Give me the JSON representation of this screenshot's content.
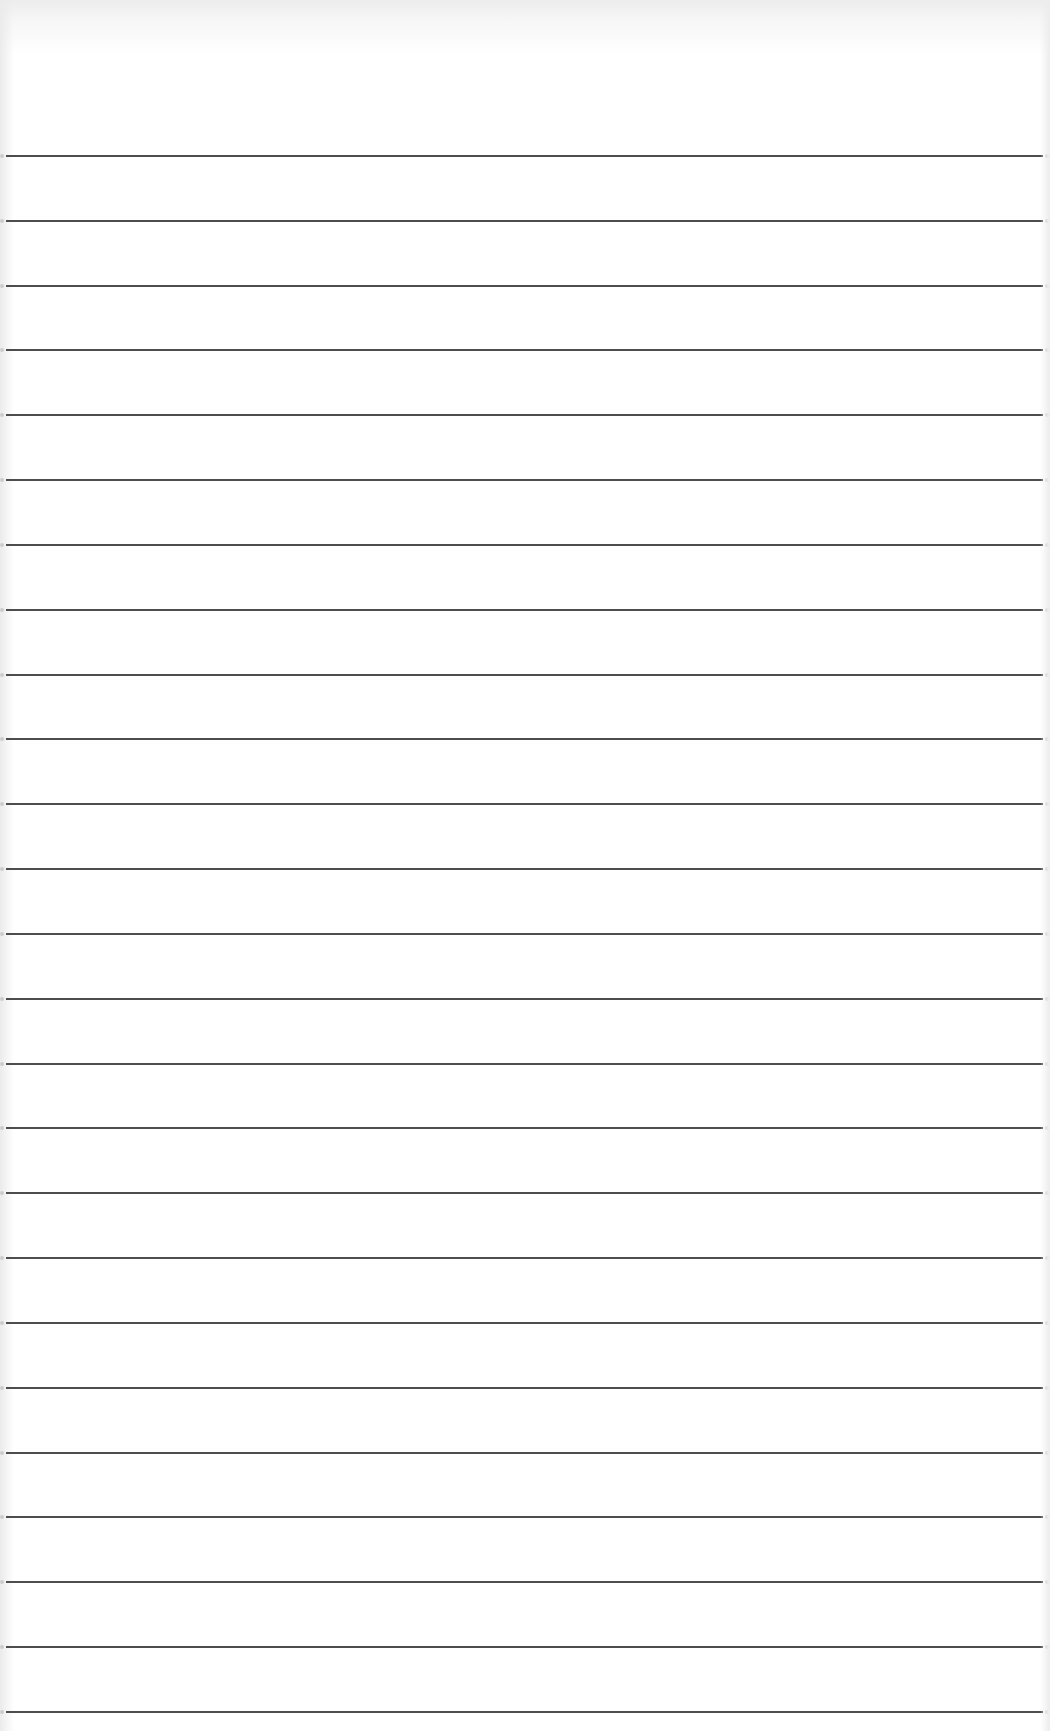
{
  "page": {
    "type": "blank ruled notepad sheet",
    "background_color": "#ffffff",
    "line_color": "#3a3a3a",
    "line_count": 25,
    "first_line_y": 155,
    "line_spacing": 64.83,
    "line_left_x": 6,
    "line_right_x": 1043,
    "text_content": []
  }
}
